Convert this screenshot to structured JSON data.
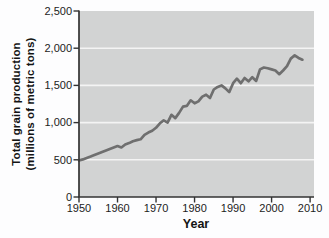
{
  "figure": {
    "background": "#fdfdfe",
    "plot_bg": "#d2d3d3",
    "grid_color": "#f4f4f4",
    "line_color": "#6f6f6f",
    "axis_color": "#333333",
    "text_color": "#1c1c1c"
  },
  "chart_data": {
    "type": "line",
    "title": "",
    "xlabel": "Year",
    "ylabel_line1": "Total grain production",
    "ylabel_line2": "(millions of metric tons)",
    "xlim": [
      1950,
      2010
    ],
    "ylim": [
      0,
      2500
    ],
    "x_ticks": [
      1950,
      1960,
      1970,
      1980,
      1990,
      2000,
      2010
    ],
    "y_ticks": [
      0,
      500,
      1000,
      1500,
      2000,
      2500
    ],
    "y_tick_labels": [
      "0",
      "500",
      "1,000",
      "1,500",
      "2,000",
      "2,500"
    ],
    "grid": "horizontal-white-gridlines",
    "legend": "none",
    "series_label": "Total grain production (millions of metric tons)",
    "x": [
      1950,
      1951,
      1952,
      1953,
      1954,
      1955,
      1956,
      1957,
      1958,
      1959,
      1960,
      1961,
      1962,
      1963,
      1964,
      1965,
      1966,
      1967,
      1968,
      1969,
      1970,
      1971,
      1972,
      1973,
      1974,
      1975,
      1976,
      1977,
      1978,
      1979,
      1980,
      1981,
      1982,
      1983,
      1984,
      1985,
      1986,
      1987,
      1988,
      1989,
      1990,
      1991,
      1992,
      1993,
      1994,
      1995,
      1996,
      1997,
      1998,
      1999,
      2000,
      2001,
      2002,
      2003,
      2004,
      2005,
      2006,
      2007,
      2008
    ],
    "values": [
      490,
      505,
      525,
      545,
      565,
      585,
      605,
      625,
      645,
      665,
      685,
      665,
      705,
      725,
      750,
      765,
      775,
      835,
      865,
      890,
      930,
      990,
      1030,
      1000,
      1105,
      1060,
      1130,
      1215,
      1225,
      1300,
      1260,
      1285,
      1350,
      1375,
      1330,
      1445,
      1480,
      1500,
      1460,
      1410,
      1530,
      1590,
      1530,
      1600,
      1555,
      1610,
      1560,
      1715,
      1740,
      1730,
      1715,
      1700,
      1650,
      1700,
      1760,
      1860,
      1905,
      1870,
      1845
    ]
  }
}
